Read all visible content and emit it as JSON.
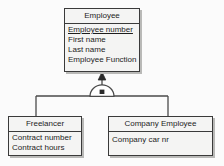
{
  "diagram": {
    "type": "uml-class-diagram",
    "relationship": "generalization",
    "constraint_symbol": "disjoint-specialization-arc",
    "colors": {
      "box_fill": "#f4f4f3",
      "border": "#3a3a3a",
      "shadow": "#b9b9b7",
      "line": "#4a4a4a",
      "canvas": "#fbfbfb",
      "text": "#1d1d1d"
    }
  },
  "classes": {
    "employee": {
      "name": "Employee",
      "attributes": [
        {
          "label": "Employee number",
          "key": true
        },
        {
          "label": "First name",
          "key": false
        },
        {
          "label": "Last name",
          "key": false
        },
        {
          "label": "Employee Function",
          "key": false
        }
      ]
    },
    "freelancer": {
      "name": "Freelancer",
      "attributes": [
        {
          "label": "Contract number",
          "key": false
        },
        {
          "label": "Contract hours",
          "key": false
        }
      ]
    },
    "company_employee": {
      "name": "Company Employee",
      "attributes": [
        {
          "label": "Company car nr",
          "key": false
        }
      ]
    }
  }
}
